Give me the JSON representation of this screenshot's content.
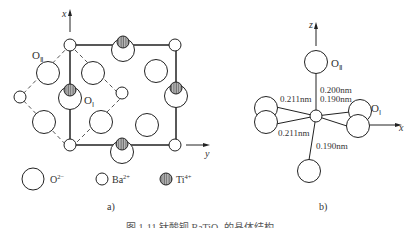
{
  "panel_a": {
    "axis_x": "x",
    "axis_y": "y",
    "label_O2": "O",
    "label_O2_sub": "Ⅱ",
    "label_O1": "O",
    "label_O1_sub": "Ⅰ",
    "caption": "a)",
    "legend": [
      {
        "symbol": "large-open-circle",
        "ion": "O",
        "charge": "2−"
      },
      {
        "symbol": "small-open-circle",
        "ion": "Ba",
        "charge": "2+"
      },
      {
        "symbol": "hatched-circle",
        "ion": "Ti",
        "charge": "4+"
      }
    ]
  },
  "panel_b": {
    "axis_z": "z",
    "axis_x": "x",
    "label_O2": "O",
    "label_O2_sub": "Ⅱ",
    "label_O1": "O",
    "label_O1_sub": "Ⅰ",
    "bond_top_up": "0.200nm",
    "bond_top_down": "0.190nm",
    "bond_left_upper": "0.211nm",
    "bond_left_lower": "0.211nm",
    "bond_bottom": "0.190nm",
    "caption": "b)"
  },
  "figure_caption": "图 1-11  钛酸钡 BaTiO₃ 的晶体结构"
}
